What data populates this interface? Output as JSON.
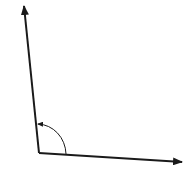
{
  "diagram": {
    "type": "angle",
    "stroke_color": "#1a1a1a",
    "background": "#ffffff",
    "vertex": [
      39,
      153
    ],
    "rays": [
      {
        "name": "vertical-ray",
        "from": [
          39,
          153
        ],
        "to": [
          24,
          4
        ]
      },
      {
        "name": "horizontal-ray",
        "from": [
          39,
          153
        ],
        "to": [
          184,
          162
        ]
      }
    ],
    "angle_arc": {
      "from": [
        66,
        154
      ],
      "to": [
        37,
        123
      ],
      "direction": "counterclockwise"
    }
  }
}
